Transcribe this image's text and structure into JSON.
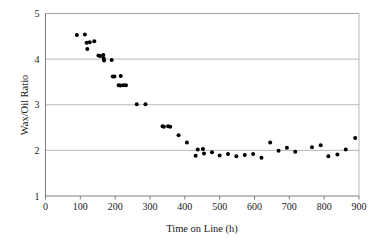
{
  "chart_data": {
    "type": "scatter",
    "title": "",
    "xlabel": "Time on Line (h)",
    "ylabel": "Wax/Oil Ratio",
    "xlim": [
      0,
      900
    ],
    "ylim": [
      1,
      5
    ],
    "xticks": [
      0,
      100,
      200,
      300,
      400,
      500,
      600,
      700,
      800,
      900
    ],
    "yticks": [
      1,
      2,
      3,
      4,
      5
    ],
    "xtick_labels": [
      "0",
      "100",
      "200",
      "300",
      "400",
      "500",
      "600",
      "700",
      "800",
      "900"
    ],
    "ytick_labels": [
      "1",
      "2",
      "3",
      "4",
      "5"
    ],
    "grid": "horizontal",
    "legend": "none",
    "marker": "filled-circle",
    "marker_color": "#000000",
    "series": [
      {
        "name": "Wax/Oil Ratio",
        "points": [
          [
            90,
            4.53
          ],
          [
            113,
            4.54
          ],
          [
            118,
            4.36
          ],
          [
            120,
            4.22
          ],
          [
            127,
            4.37
          ],
          [
            140,
            4.39
          ],
          [
            152,
            4.08
          ],
          [
            157,
            4.07
          ],
          [
            166,
            4.09
          ],
          [
            167,
            4.02
          ],
          [
            168,
            3.97
          ],
          [
            190,
            3.98
          ],
          [
            193,
            3.62
          ],
          [
            198,
            3.62
          ],
          [
            216,
            3.63
          ],
          [
            210,
            3.43
          ],
          [
            215,
            3.42
          ],
          [
            224,
            3.43
          ],
          [
            231,
            3.43
          ],
          [
            262,
            3.01
          ],
          [
            287,
            3.01
          ],
          [
            336,
            2.53
          ],
          [
            340,
            2.52
          ],
          [
            352,
            2.53
          ],
          [
            358,
            2.52
          ],
          [
            382,
            2.33
          ],
          [
            406,
            2.17
          ],
          [
            431,
            1.88
          ],
          [
            437,
            2.02
          ],
          [
            452,
            2.03
          ],
          [
            455,
            1.93
          ],
          [
            478,
            1.96
          ],
          [
            500,
            1.89
          ],
          [
            524,
            1.92
          ],
          [
            548,
            1.87
          ],
          [
            572,
            1.9
          ],
          [
            596,
            1.92
          ],
          [
            620,
            1.84
          ],
          [
            645,
            2.17
          ],
          [
            669,
            1.99
          ],
          [
            693,
            2.06
          ],
          [
            717,
            1.97
          ],
          [
            765,
            2.07
          ],
          [
            790,
            2.11
          ],
          [
            812,
            1.87
          ],
          [
            838,
            1.91
          ],
          [
            862,
            2.02
          ],
          [
            889,
            2.27
          ]
        ]
      }
    ]
  },
  "axes": {
    "x_title": "Time on Line (h)",
    "y_title": "Wax/Oil Ratio"
  }
}
